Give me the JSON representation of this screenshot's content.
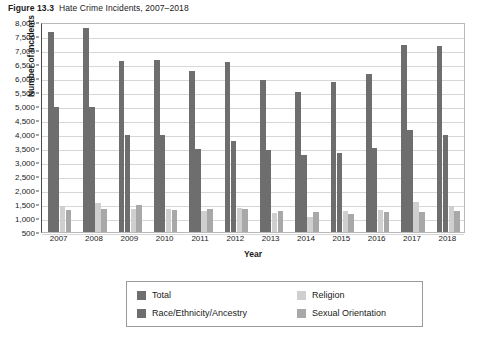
{
  "figure": {
    "number": "Figure 13.3",
    "title": "Hate Crime Incidents, 2007–2018"
  },
  "chart_data": {
    "type": "bar",
    "title": "Hate Crime Incidents, 2007–2018",
    "xlabel": "Year",
    "ylabel": "Number of Incidents",
    "ylim": [
      500,
      8000
    ],
    "ytick_step": 500,
    "ytick_labels": [
      "8,000",
      "7,500",
      "7,000",
      "6,500",
      "6,000",
      "5,500",
      "5,000",
      "4,500",
      "4,000",
      "3,500",
      "3,000",
      "2,500",
      "2,000",
      "1,500",
      "1,000",
      "500"
    ],
    "grid": true,
    "legend_position": "bottom",
    "categories": [
      "2007",
      "2008",
      "2009",
      "2010",
      "2011",
      "2012",
      "2013",
      "2014",
      "2015",
      "2016",
      "2017",
      "2018"
    ],
    "series": [
      {
        "name": "Total",
        "color": "#6e6e6e",
        "values": [
          7620,
          7780,
          6600,
          6620,
          6220,
          6570,
          5920,
          5480,
          5850,
          6120,
          7170,
          7120
        ]
      },
      {
        "name": "Race/Ethnicity/Ancestry",
        "color": "#6e6e6e",
        "values": [
          4950,
          4930,
          3960,
          3950,
          3460,
          3740,
          3410,
          3230,
          3310,
          3490,
          4130,
          3960
        ]
      },
      {
        "name": "Religion",
        "color": "#cfcfcf",
        "values": [
          1400,
          1520,
          1300,
          1320,
          1230,
          1340,
          1160,
          1010,
          1240,
          1270,
          1560,
          1420
        ]
      },
      {
        "name": "Sexual Orientation",
        "color": "#a8a8a8",
        "values": [
          1260,
          1290,
          1430,
          1280,
          1300,
          1320,
          1230,
          1180,
          1110,
          1180,
          1200,
          1240
        ]
      }
    ]
  },
  "legend": {
    "items": [
      {
        "label": "Total",
        "swatch": "total"
      },
      {
        "label": "Religion",
        "swatch": "religion"
      },
      {
        "label": "Race/Ethnicity/Ancestry",
        "swatch": "race"
      },
      {
        "label": "Sexual Orientation",
        "swatch": "orientation"
      }
    ]
  }
}
